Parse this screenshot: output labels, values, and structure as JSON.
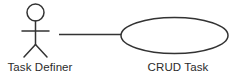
{
  "diagram": {
    "type": "uml-use-case-diagram",
    "background_color": "#ffffff",
    "stroke_color": "#333333",
    "text_color": "#2b2b2b",
    "actor": {
      "label": "Task Definer",
      "icon": "stick-figure-actor"
    },
    "use_case": {
      "label": "CRUD Task",
      "shape": "ellipse"
    },
    "association": {
      "label": "",
      "style": "solid-line"
    }
  }
}
